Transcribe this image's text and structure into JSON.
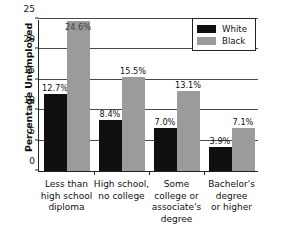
{
  "chart_data": {
    "type": "bar",
    "title": "",
    "xlabel": "",
    "ylabel": "Percentage Unemployed",
    "ylim": [
      0,
      25
    ],
    "yticks": [
      0,
      5,
      10,
      15,
      20,
      25
    ],
    "ytick_labels": [
      "0",
      "5",
      "10",
      "15",
      "20",
      "25"
    ],
    "grid": true,
    "grid_axis": "y",
    "legend_position": "top-right",
    "categories": [
      "Less than high school diploma",
      "High school, no college",
      "Some college or associate's degree",
      "Bachelor's degree or higher"
    ],
    "category_lines": [
      [
        "Less than",
        "high school",
        "diploma"
      ],
      [
        "High school,",
        "no college"
      ],
      [
        "Some",
        "college or",
        "associate's",
        "degree"
      ],
      [
        "Bachelor's",
        "degree",
        "or higher"
      ]
    ],
    "series": [
      {
        "name": "White",
        "color": "#101010",
        "values": [
          12.7,
          8.4,
          7.0,
          3.9
        ],
        "labels": [
          "12.7%",
          "8.4%",
          "7.0%",
          "3.9%"
        ]
      },
      {
        "name": "Black",
        "color": "#9b9b9b",
        "values": [
          24.6,
          15.5,
          13.1,
          7.1
        ],
        "labels": [
          "24.6%",
          "15.5%",
          "13.1%",
          "7.1%"
        ]
      }
    ]
  },
  "legend": {
    "items": [
      {
        "label": "White",
        "series_class": "white-series"
      },
      {
        "label": "Black",
        "series_class": "black-series"
      }
    ]
  }
}
